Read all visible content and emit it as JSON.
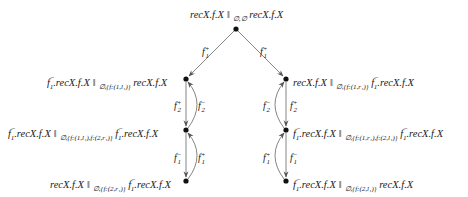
{
  "diagram": {
    "type": "state transition graph",
    "nodes": {
      "root": {
        "left": "recX.f.X",
        "sub": "∅,∅",
        "right": "recX.f.X"
      },
      "l1": {
        "left": "f1⁻.recX.f.X",
        "sub": "∅,{f:(1,l1)}",
        "right": "recX.f.X"
      },
      "l2": {
        "left": "f1⁻.recX.f.X",
        "sub": "∅,{f:(1,l1),f:(2,r1)}",
        "right": "f1⁻.recX.f.X"
      },
      "l3": {
        "left": "recX.f.X",
        "sub": "∅,{f:(2,r1)}",
        "right": "f1⁻.recX.f.X"
      },
      "r1": {
        "left": "recX.f.X",
        "sub": "∅,{f:(1,r1)}",
        "right": "f1⁻.recX.f.X"
      },
      "r2": {
        "left": "f1⁻.recX.f.X",
        "sub": "∅,{f:(1,r1),f:(2,l1)}",
        "right": "f1⁻.recX.f.X"
      },
      "r3": {
        "left": "f1⁻.recX.f.X",
        "sub": "∅,{f:(2,l1)}",
        "right": "recX.f.X"
      }
    },
    "edges": [
      {
        "from": "root",
        "to": "l1",
        "label": "f1+"
      },
      {
        "from": "root",
        "to": "r1",
        "label": "f1+"
      },
      {
        "from": "l1",
        "to": "l2",
        "label": "f2+"
      },
      {
        "from": "l2",
        "to": "l1",
        "label": "f2-"
      },
      {
        "from": "l2",
        "to": "l3",
        "label": "f1-"
      },
      {
        "from": "l3",
        "to": "l2",
        "label": "f1+"
      },
      {
        "from": "r1",
        "to": "r2",
        "label": "f2+"
      },
      {
        "from": "r2",
        "to": "r1",
        "label": "f2-"
      },
      {
        "from": "r2",
        "to": "r3",
        "label": "f1-"
      },
      {
        "from": "r3",
        "to": "r2",
        "label": "f1+"
      }
    ],
    "parallel_symbol": "‖",
    "text": {
      "recx": "recX.f.X",
      "f1minus": "f",
      "sub_root": "∅,∅",
      "sub_l1": "∅,{f:(1,l₁)}",
      "sub_l2": "∅,{f:(1,l₁),f:(2,r₁)}",
      "sub_l3": "∅,{f:(2,r₁)}",
      "sub_r1": "∅,{f:(1,r₁)}",
      "sub_r2": "∅,{f:(1,r₁),f:(2,l₁)}",
      "sub_r3": "∅,{f:(2,l₁)}",
      "f": "f",
      "plus": "+",
      "minus": "−",
      "one": "1",
      "two": "2",
      "dot_recx": ".recX.f.X"
    }
  }
}
